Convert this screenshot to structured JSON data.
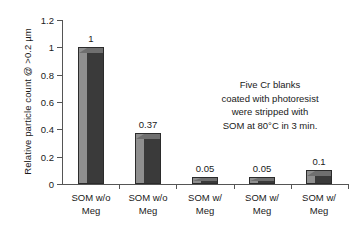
{
  "chart_data": {
    "type": "bar",
    "title": "",
    "xlabel": "",
    "ylabel": "Relative particle count @ >0.2 µm",
    "ylim": [
      0,
      1.2
    ],
    "grid": false,
    "legend": null,
    "categories": [
      "SOM w/o Meg",
      "SOM w/o Meg",
      "SOM w/ Meg",
      "SOM w/ Meg",
      "SOM w/ Meg"
    ],
    "category_lines": [
      [
        "SOM w/o",
        "Meg"
      ],
      [
        "SOM w/o",
        "Meg"
      ],
      [
        "SOM w/",
        "Meg"
      ],
      [
        "SOM w/",
        "Meg"
      ],
      [
        "SOM w/",
        "Meg"
      ]
    ],
    "values": [
      1,
      0.37,
      0.05,
      0.05,
      0.1
    ],
    "value_labels": [
      "1",
      "0.37",
      "0.05",
      "0.05",
      "0.1"
    ],
    "ytick_labels": [
      "1.2",
      "1",
      "0.8",
      "0.6",
      "0.4",
      "0.2",
      "0"
    ],
    "ytick_values": [
      1.2,
      1,
      0.8,
      0.6,
      0.4,
      0.2,
      0
    ],
    "annotation_lines": [
      "Five Cr blanks",
      "coated with photoresist",
      "were stripped with",
      "SOM at 80°C in 3 min."
    ],
    "colors": {
      "bar_light": "#8f8f8f",
      "bar_dark": "#3a3a3a",
      "bar_top": "#6f6f6f",
      "bar_edge": "#2b2b2b",
      "axis": "#555555",
      "text": "#1a1a1a",
      "background": "#ffffff"
    }
  }
}
